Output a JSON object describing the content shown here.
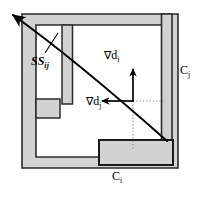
{
  "figure": {
    "colors": {
      "wall_fill": "#d2d2d2",
      "wall_stroke": "#2b2b2b",
      "line": "#000000",
      "dotted": "#8d8d8d",
      "background": "#ffffff"
    },
    "labels": {
      "ss": {
        "text": "SS",
        "sub": "ij",
        "name": "separating-surface-label"
      },
      "grad_i": {
        "nabla": "∇",
        "text": "d",
        "sub": "i",
        "name": "gradient-di-label"
      },
      "grad_j": {
        "nabla": "∇",
        "text": "d",
        "sub": "j",
        "name": "gradient-dj-label"
      },
      "c_j": {
        "text": "C",
        "sub": "j",
        "name": "boundary-cj-label"
      },
      "c_i": {
        "text": "C",
        "sub": "i",
        "name": "boundary-ci-label"
      }
    },
    "geometry": {
      "outer_wall": "M 22,14 L 178,14 L 178,168 L 22,168 Z",
      "inner_void": "M 36,25 L 167,25 L 167,157 L 36,157 Z",
      "partition_vertical": "M 62,25 L 72,25 L 72,104 L 62,104 Z",
      "left_notch": "M 36,100 L 60,100 L 60,118 L 36,118 Z",
      "bottom_block": "M 100,140 L 172,140 L 172,164 L 100,164 Z",
      "right_wall": "M 162,14 L 172,14 L 172,142 L 162,142 Z",
      "separating_curve": "M 11,13 C 48,40 96,78 167,141",
      "arrow_tip": "11,13",
      "grad_i_vector": {
        "from": "133,101",
        "to": "133,70"
      },
      "grad_j_vector": {
        "from": "133,101",
        "to": "103,101"
      },
      "origin_point": "133,101",
      "dotted_h": {
        "from": "133,101",
        "to": "166,101"
      },
      "dotted_v": {
        "from": "133,101",
        "to": "133,148"
      },
      "leader_line": {
        "from": "44,52",
        "to": "57,33"
      }
    }
  }
}
